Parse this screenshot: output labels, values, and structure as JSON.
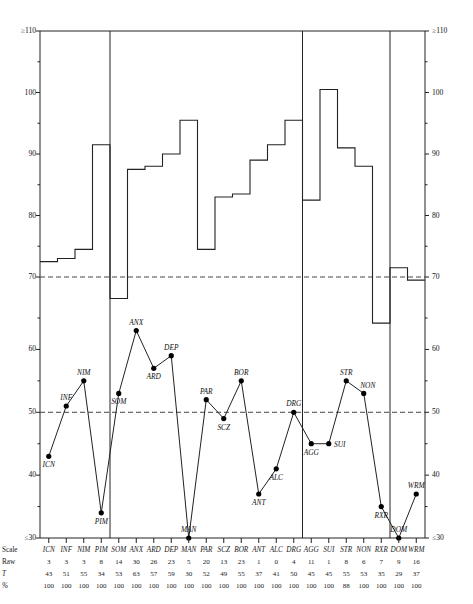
{
  "page": {
    "kind": "psychological-assessment-profile-sheet",
    "row_labels": {
      "scale": "Scale",
      "raw": "Raw",
      "t": "T",
      "pct": "%"
    }
  },
  "axes": {
    "upper": {
      "top_label": "≥110",
      "bottom_label": "70",
      "major_ticks": [
        "≥110",
        "100",
        "90",
        "80",
        "70"
      ],
      "major_values": [
        110,
        100,
        90,
        80,
        70
      ],
      "minor_values": [
        105,
        95,
        85,
        75
      ],
      "reference_line": 70
    },
    "lower": {
      "top_label": "60",
      "bottom_label": "≤30",
      "major_ticks": [
        "60",
        "50",
        "40",
        "≤30"
      ],
      "major_values": [
        60,
        50,
        40,
        30
      ],
      "minor_values": [
        65,
        55,
        45,
        35
      ],
      "reference_line": 50
    }
  },
  "chart_data": {
    "type": "line",
    "title": "",
    "xlabel": "",
    "ylabel": "",
    "grid": false,
    "legend": "none",
    "categories": [
      "ICN",
      "INF",
      "NIM",
      "PIM",
      "SOM",
      "ANX",
      "ARD",
      "DEP",
      "MAN",
      "PAR",
      "SCZ",
      "BOR",
      "ANT",
      "ALC",
      "DRG",
      "AGG",
      "SUI",
      "STR",
      "NON",
      "RXR",
      "DOM",
      "WRM"
    ],
    "group_dividers_after": [
      "PIM",
      "DRG",
      "RXR"
    ],
    "series": [
      {
        "name": "Raw",
        "values": [
          3,
          3,
          3,
          8,
          14,
          30,
          26,
          23,
          5,
          20,
          13,
          23,
          1,
          0,
          4,
          11,
          1,
          8,
          6,
          7,
          9,
          16
        ]
      },
      {
        "name": "T",
        "values": [
          43,
          51,
          55,
          34,
          53,
          63,
          57,
          59,
          30,
          52,
          49,
          55,
          37,
          41,
          50,
          45,
          45,
          55,
          53,
          35,
          29,
          37
        ]
      },
      {
        "name": "%",
        "values": [
          100,
          100,
          100,
          100,
          100,
          100,
          100,
          100,
          100,
          100,
          100,
          100,
          100,
          100,
          100,
          100,
          100,
          88,
          100,
          100,
          100,
          100
        ]
      },
      {
        "name": "Percentile step (upper panel)",
        "values": [
          72.5,
          73,
          74.5,
          91.5,
          66.5,
          87.5,
          88,
          90,
          95.5,
          74.5,
          83,
          83.5,
          89,
          91.5,
          95.5,
          82.5,
          100.5,
          91,
          88,
          62.5,
          71.5,
          69.5
        ]
      }
    ],
    "ylim_upper": [
      70,
      110
    ],
    "ylim_lower": [
      30,
      65
    ]
  },
  "table": {
    "columns": [
      {
        "scale": "ICN",
        "raw": "3",
        "t": "43",
        "pct": "100"
      },
      {
        "scale": "INF",
        "raw": "3",
        "t": "51",
        "pct": "100"
      },
      {
        "scale": "NIM",
        "raw": "3",
        "t": "55",
        "pct": "100"
      },
      {
        "scale": "PIM",
        "raw": "8",
        "t": "34",
        "pct": "100"
      },
      {
        "scale": "SOM",
        "raw": "14",
        "t": "53",
        "pct": "100"
      },
      {
        "scale": "ANX",
        "raw": "30",
        "t": "63",
        "pct": "100"
      },
      {
        "scale": "ARD",
        "raw": "26",
        "t": "57",
        "pct": "100"
      },
      {
        "scale": "DEP",
        "raw": "23",
        "t": "59",
        "pct": "100"
      },
      {
        "scale": "MAN",
        "raw": "5",
        "t": "30",
        "pct": "100"
      },
      {
        "scale": "PAR",
        "raw": "20",
        "t": "52",
        "pct": "100"
      },
      {
        "scale": "SCZ",
        "raw": "13",
        "t": "49",
        "pct": "100"
      },
      {
        "scale": "BOR",
        "raw": "23",
        "t": "55",
        "pct": "100"
      },
      {
        "scale": "ANT",
        "raw": "1",
        "t": "37",
        "pct": "100"
      },
      {
        "scale": "ALC",
        "raw": "0",
        "t": "41",
        "pct": "100"
      },
      {
        "scale": "DRG",
        "raw": "4",
        "t": "50",
        "pct": "100"
      },
      {
        "scale": "AGG",
        "raw": "11",
        "t": "45",
        "pct": "100"
      },
      {
        "scale": "SUI",
        "raw": "1",
        "t": "45",
        "pct": "100"
      },
      {
        "scale": "STR",
        "raw": "8",
        "t": "55",
        "pct": "88"
      },
      {
        "scale": "NON",
        "raw": "6",
        "t": "53",
        "pct": "100"
      },
      {
        "scale": "RXR",
        "raw": "7",
        "t": "35",
        "pct": "100"
      },
      {
        "scale": "DOM",
        "raw": "9",
        "t": "29",
        "pct": "100"
      },
      {
        "scale": "WRM",
        "raw": "16",
        "t": "37",
        "pct": "100"
      }
    ]
  },
  "style": {
    "ink": "#111111",
    "line": "#222222",
    "dash": "#444444"
  }
}
